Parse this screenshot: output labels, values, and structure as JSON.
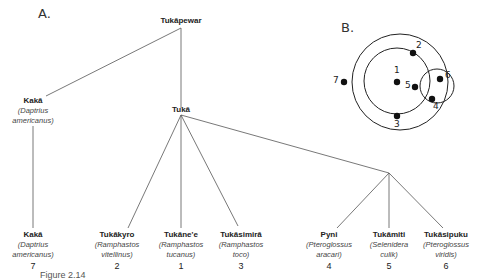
{
  "panel_a": {
    "label": "A.",
    "root": {
      "name": "Tukāpewar"
    },
    "upper_kaka": {
      "name": "Kakā",
      "sci_line1": "(Daptrius",
      "sci_line2": "americanus)"
    },
    "tuka": {
      "name": "Tukā"
    },
    "leaves": [
      {
        "name": "Kakā",
        "sci_line1": "(Daptrius",
        "sci_line2": "americanus)",
        "num": "7"
      },
      {
        "name": "Tukākyro",
        "sci_line1": "(Ramphastos",
        "sci_line2": "vitellinus)",
        "num": "2"
      },
      {
        "name": "Tukāne'e",
        "sci_line1": "(Ramphastos",
        "sci_line2": "tucanus)",
        "num": "1"
      },
      {
        "name": "Tukāsimirā",
        "sci_line1": "(Ramphastos",
        "sci_line2": "toco)",
        "num": "3"
      },
      {
        "name": "Pyni",
        "sci_line1": "(Pteroglossus",
        "sci_line2": "aracari)",
        "num": "4"
      },
      {
        "name": "Tukāmiti",
        "sci_line1": "(Selenidera",
        "sci_line2": "culik)",
        "num": "5"
      },
      {
        "name": "Tukāsipuku",
        "sci_line1": "(Pteroglossus",
        "sci_line2": "viridis)",
        "num": "6"
      }
    ]
  },
  "panel_b": {
    "label": "B.",
    "points": [
      "1",
      "2",
      "3",
      "4",
      "5",
      "6",
      "7"
    ]
  },
  "caption": "Figure 2.14"
}
